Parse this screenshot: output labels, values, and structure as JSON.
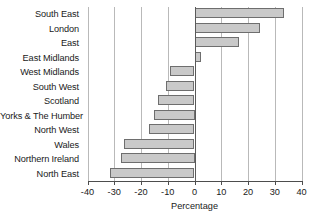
{
  "chart_data": {
    "type": "bar",
    "orientation": "horizontal",
    "title": "",
    "xlabel": "Percentage",
    "ylabel": "",
    "xlim": [
      -40,
      40
    ],
    "xticks": [
      -40,
      -30,
      -20,
      -10,
      0,
      10,
      20,
      30,
      40
    ],
    "xtick_labels": [
      "-40",
      "-30",
      "-20",
      "-10",
      "0",
      "10",
      "20",
      "30",
      "40"
    ],
    "grid": true,
    "grid_axis": "x",
    "legend": false,
    "categories": [
      "South East",
      "London",
      "East",
      "East Midlands",
      "West Midlands",
      "South West",
      "Scotland",
      "Yorks & The Humber",
      "North West",
      "Wales",
      "Northern Ireland",
      "North East"
    ],
    "values": [
      33.5,
      24.5,
      16.5,
      2.5,
      -9,
      -10.5,
      -13.5,
      -15,
      -17,
      -26.5,
      -27.5,
      -31.5
    ],
    "bar_fill_color": "#c9c9c9",
    "bar_edge_color": "#6e6e6e",
    "gridline_color": "#b9b9b9",
    "axis_color": "#4d4d4d",
    "background_color": "#ffffff"
  }
}
